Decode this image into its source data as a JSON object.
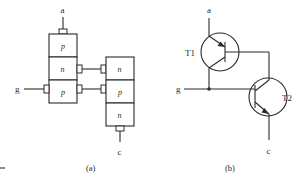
{
  "figure_a": {
    "caption": "(a)",
    "terminals": {
      "anode": "a",
      "gate": "g",
      "cathode": "c"
    },
    "left_stack": [
      {
        "label": "p"
      },
      {
        "label": "n"
      },
      {
        "label": "p"
      }
    ],
    "right_stack": [
      {
        "label": "n"
      },
      {
        "label": "p"
      },
      {
        "label": "n"
      }
    ]
  },
  "figure_b": {
    "caption": "(b)",
    "terminals": {
      "anode": "a",
      "gate": "g",
      "cathode": "c"
    },
    "transistors": [
      {
        "label": "T1",
        "type": "pnp"
      },
      {
        "label": "T2",
        "type": "npn"
      }
    ]
  },
  "colors": {
    "line": "#2a2a2a",
    "background": "#ffffff"
  }
}
